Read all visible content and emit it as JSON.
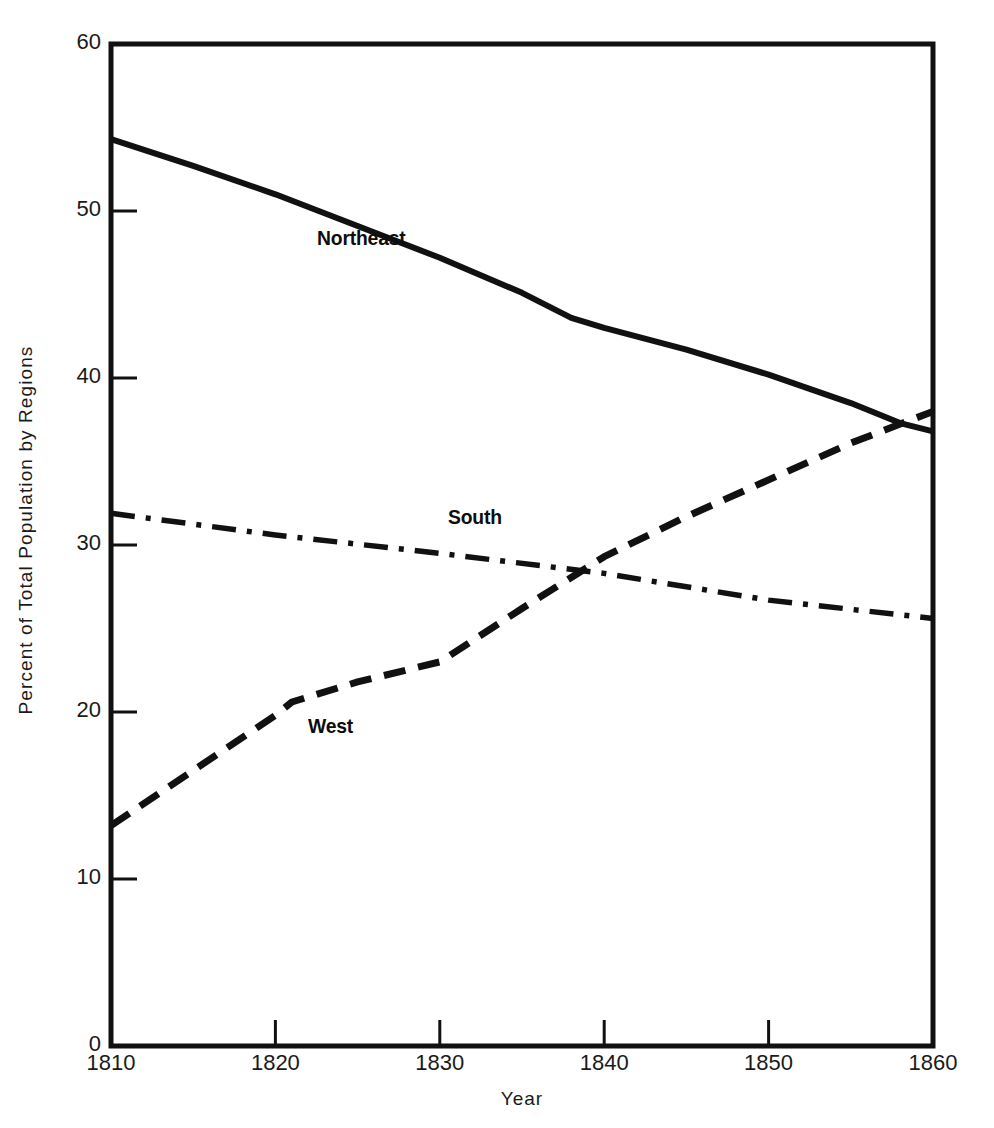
{
  "chart_data": {
    "type": "line",
    "title": "",
    "xlabel": "Year",
    "ylabel": "Percent of Total Population by Regions",
    "xlim": [
      1810,
      1860
    ],
    "ylim": [
      0,
      60
    ],
    "xticks": [
      "1810",
      "1820",
      "1830",
      "1840",
      "1850",
      "1860"
    ],
    "yticks": [
      "0",
      "10",
      "20",
      "30",
      "40",
      "50",
      "60"
    ],
    "grid": false,
    "legend": "inline-labels",
    "x": [
      1810,
      1820,
      1830,
      1840,
      1850,
      1860
    ],
    "series": [
      {
        "name": "Northeast",
        "style": "solid",
        "label_x": 1810,
        "label_y": 60,
        "values": [
          54.3,
          51.0,
          47.2,
          43.0,
          40.2,
          36.8
        ],
        "points": [
          [
            1810,
            54.3
          ],
          [
            1815,
            52.7
          ],
          [
            1820,
            51.0
          ],
          [
            1825,
            49.1
          ],
          [
            1830,
            47.2
          ],
          [
            1835,
            45.1
          ],
          [
            1838,
            43.6
          ],
          [
            1840,
            43.0
          ],
          [
            1845,
            41.7
          ],
          [
            1850,
            40.2
          ],
          [
            1855,
            38.5
          ],
          [
            1858,
            37.3
          ],
          [
            1860,
            36.8
          ]
        ]
      },
      {
        "name": "South",
        "style": "dash-dot",
        "values": [
          31.9,
          30.6,
          29.5,
          28.3,
          26.7,
          25.6
        ],
        "points": [
          [
            1810,
            31.9
          ],
          [
            1820,
            30.6
          ],
          [
            1830,
            29.5
          ],
          [
            1840,
            28.3
          ],
          [
            1850,
            26.7
          ],
          [
            1860,
            25.6
          ]
        ]
      },
      {
        "name": "West",
        "style": "dashed",
        "values": [
          13.2,
          19.8,
          23.0,
          29.3,
          33.9,
          38.0
        ],
        "points": [
          [
            1810,
            13.2
          ],
          [
            1820,
            19.8
          ],
          [
            1821,
            20.6
          ],
          [
            1825,
            21.8
          ],
          [
            1830,
            23.0
          ],
          [
            1835,
            26.2
          ],
          [
            1840,
            29.3
          ],
          [
            1845,
            31.7
          ],
          [
            1850,
            33.9
          ],
          [
            1855,
            36.1
          ],
          [
            1860,
            38.0
          ]
        ]
      }
    ],
    "annotations": [
      {
        "text": "Northeast",
        "x": 1822.5,
        "y": 48.3
      },
      {
        "text": "South",
        "x": 1830.5,
        "y": 31.6
      },
      {
        "text": "West",
        "x": 1822.0,
        "y": 19.1
      }
    ],
    "colors": {
      "line": "#111111",
      "text": "#1a1a1a",
      "background": "#ffffff"
    }
  }
}
